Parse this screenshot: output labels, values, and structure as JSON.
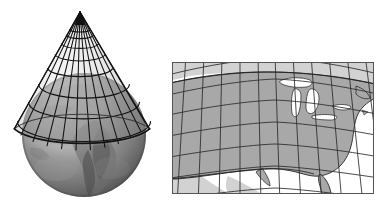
{
  "figure": {
    "background_color": "#ffffff",
    "panels": [
      {
        "name": "globe-with-cone",
        "description": "Grayscale photographic globe showing Africa and the Atlantic, with a wireframe cone of latitude/longitude graticule lines set over the northern hemisphere",
        "apex": {
          "x": 80,
          "y": 12
        },
        "globe": {
          "center_x": 84,
          "center_y": 135,
          "radius": 62
        },
        "cone_base": {
          "left_x": 14,
          "right_x": 149,
          "y": 129
        },
        "graticule": {
          "meridians": 13,
          "parallels": 7,
          "line_color": "#111111"
        },
        "colors": {
          "globe_light": "#b9b9b9",
          "globe_mid": "#8e8e8e",
          "globe_dark": "#5d5d5d",
          "cone_shade": "#9a9a9a",
          "line": "#111111"
        }
      },
      {
        "name": "projected-us-map",
        "description": "Resulting conic projection map of the contiguous United States with curved parallels and converging meridians inside a rectangular neat line frame",
        "frame": {
          "x": 2,
          "y": 4,
          "width": 203,
          "height": 132
        },
        "graticule": {
          "meridians": 12,
          "parallels": 6,
          "line_color": "#2a2a2a"
        },
        "colors": {
          "land_us": "#a8a8a8",
          "land_other": "#d2d2d2",
          "ocean": "#ffffff",
          "lakes": "#ffffff",
          "coastline": "#1c1c1c",
          "frame": "#555555",
          "grid": "#2a2a2a"
        },
        "features": [
          "Great Lakes",
          "Florida peninsula",
          "Gulf of Mexico",
          "Baja California",
          "Atlantic coast",
          "Pacific coast",
          "Canada",
          "Mexico"
        ]
      }
    ]
  }
}
